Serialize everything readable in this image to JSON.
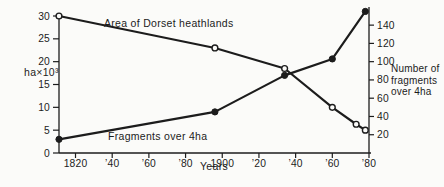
{
  "figure": {
    "background": "#fbfbf9",
    "ink": "#1c1c1c"
  },
  "chart_data": {
    "type": "line",
    "title": "",
    "xlabel": "Years",
    "grid": false,
    "x_axis": {
      "range_years": [
        1811,
        1980
      ],
      "ticks": [
        {
          "year": 1820,
          "label": "1820"
        },
        {
          "year": 1840,
          "label": "’40"
        },
        {
          "year": 1860,
          "label": "’60"
        },
        {
          "year": 1880,
          "label": "’80"
        },
        {
          "year": 1900,
          "label": "1900"
        },
        {
          "year": 1920,
          "label": "’20"
        },
        {
          "year": 1940,
          "label": "’40"
        },
        {
          "year": 1960,
          "label": "’60"
        },
        {
          "year": 1980,
          "label": "’80"
        }
      ]
    },
    "left_axis": {
      "label": "ha×10³",
      "range": [
        0,
        30
      ],
      "ticks": [
        0,
        5,
        10,
        15,
        20,
        25,
        30
      ]
    },
    "right_axis": {
      "label": "Number of fragments over 4ha",
      "label_lines": [
        "Number of",
        "fragments",
        "over 4ha"
      ],
      "range": [
        0,
        150
      ],
      "ticks": [
        20,
        40,
        60,
        80,
        100,
        120,
        140
      ]
    },
    "series": [
      {
        "name": "Area of Dorset heathlands",
        "axis": "left",
        "marker": "open-circle",
        "points": [
          {
            "year": 1811,
            "value": 30
          },
          {
            "year": 1896,
            "value": 23
          },
          {
            "year": 1934,
            "value": 18.5
          },
          {
            "year": 1960,
            "value": 10
          },
          {
            "year": 1973,
            "value": 6.3
          },
          {
            "year": 1978,
            "value": 5
          }
        ]
      },
      {
        "name": "Fragments over 4ha",
        "axis": "right",
        "marker": "filled-circle",
        "points": [
          {
            "year": 1811,
            "value": 15
          },
          {
            "year": 1896,
            "value": 45
          },
          {
            "year": 1934,
            "value": 85
          },
          {
            "year": 1960,
            "value": 103
          },
          {
            "year": 1978,
            "value": 155
          }
        ]
      }
    ]
  }
}
